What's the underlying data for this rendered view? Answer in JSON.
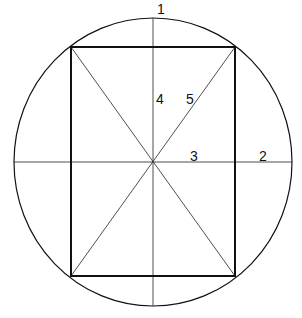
{
  "diagram": {
    "labels": [
      {
        "id": "1",
        "text": "1",
        "x": 157,
        "y": 14
      },
      {
        "id": "2",
        "text": "2",
        "x": 259,
        "y": 161
      },
      {
        "id": "3",
        "text": "3",
        "x": 190,
        "y": 161
      },
      {
        "id": "4",
        "text": "4",
        "x": 156,
        "y": 104
      },
      {
        "id": "5",
        "text": "5",
        "x": 186,
        "y": 104
      }
    ],
    "colors": {
      "stroke": "#111111",
      "background": "#ffffff"
    }
  }
}
